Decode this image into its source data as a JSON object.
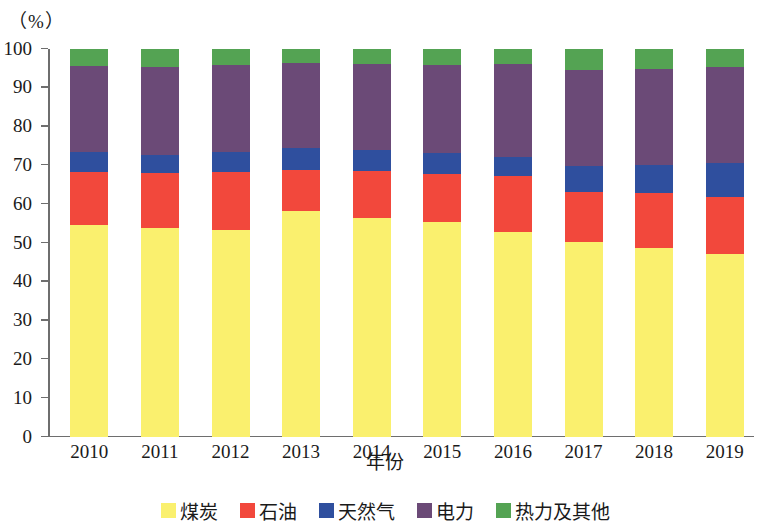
{
  "chart_data": {
    "type": "bar",
    "stacked": true,
    "title": "",
    "subtitle": "",
    "xlabel": "年份",
    "ylabel": "",
    "y_unit_label": "（%）",
    "ylim": [
      0,
      100
    ],
    "ytick_step": 10,
    "yticks": [
      0,
      10,
      20,
      30,
      40,
      50,
      60,
      70,
      80,
      90,
      100
    ],
    "grid": false,
    "legend_position": "bottom",
    "categories": [
      "2010",
      "2011",
      "2012",
      "2013",
      "2014",
      "2015",
      "2016",
      "2017",
      "2018",
      "2019"
    ],
    "series": [
      {
        "name": "煤炭",
        "color": "#faf06e",
        "values": [
          54.6,
          53.9,
          53.4,
          58.2,
          56.4,
          55.4,
          52.8,
          50.3,
          48.7,
          47.2
        ]
      },
      {
        "name": "石油",
        "color": "#f2483c",
        "values": [
          13.7,
          14.1,
          14.9,
          10.6,
          12.2,
          12.4,
          14.5,
          12.8,
          14.2,
          14.7
        ]
      },
      {
        "name": "天然气",
        "color": "#2f4f9e",
        "values": [
          5.2,
          4.7,
          5.2,
          5.7,
          5.4,
          5.4,
          4.9,
          6.7,
          7.2,
          8.7
        ]
      },
      {
        "name": "电力",
        "color": "#6b4a77",
        "values": [
          22.1,
          22.7,
          22.4,
          21.9,
          22.1,
          22.7,
          23.9,
          24.8,
          24.7,
          24.8
        ]
      },
      {
        "name": "热力及其他",
        "color": "#54a353",
        "values": [
          4.4,
          4.6,
          4.1,
          3.6,
          3.9,
          4.1,
          3.9,
          5.4,
          5.2,
          4.6
        ]
      }
    ]
  },
  "legend": {
    "items": [
      {
        "label": "煤炭",
        "color": "#faf06e"
      },
      {
        "label": "石油",
        "color": "#f2483c"
      },
      {
        "label": "天然气",
        "color": "#2f4f9e"
      },
      {
        "label": "电力",
        "color": "#6b4a77"
      },
      {
        "label": "热力及其他",
        "color": "#54a353"
      }
    ]
  }
}
